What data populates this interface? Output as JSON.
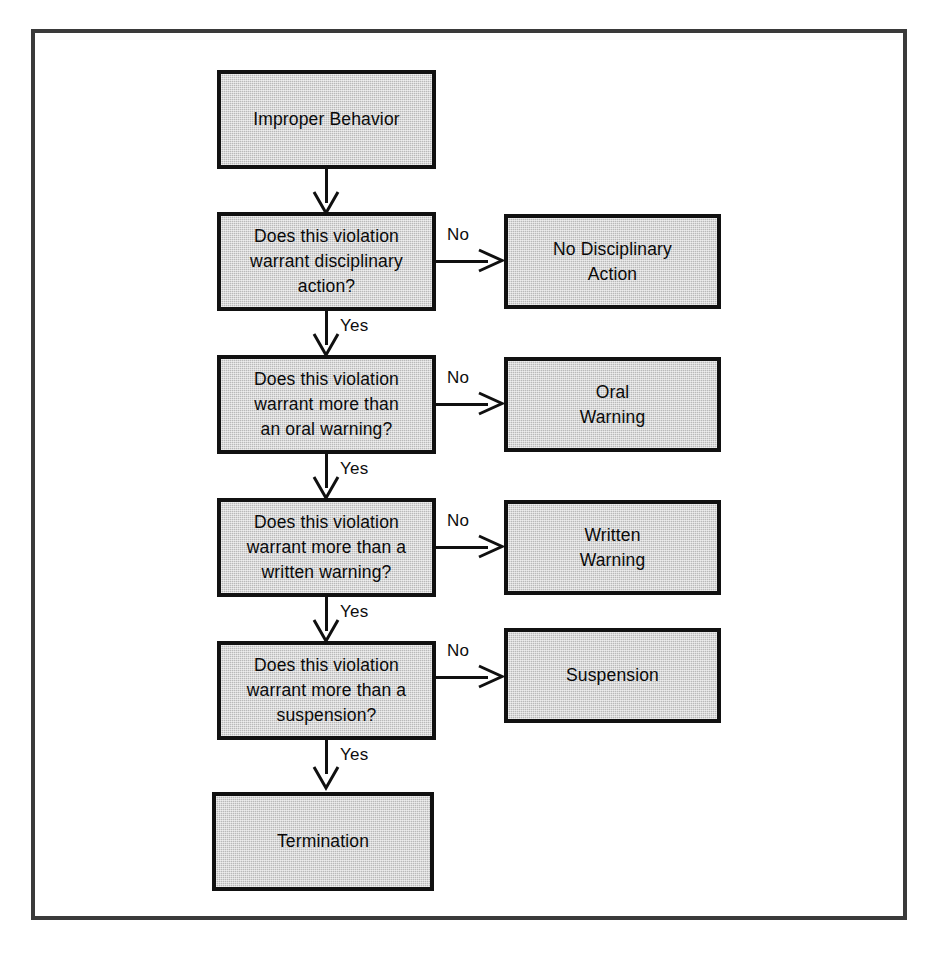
{
  "diagram": {
    "type": "flowchart",
    "colors": {
      "node_fill": "#b9b9b9",
      "node_border": "#111111",
      "frame_border": "#3a3a3a",
      "connector": "#101010",
      "background": "#ffffff",
      "text": "#0a0a0a"
    }
  },
  "nodes": {
    "start": {
      "id": "improper-behavior",
      "label": "Improper Behavior",
      "kind": "start"
    },
    "decision1": {
      "id": "decision-disciplinary-action",
      "label": "Does this violation\nwarrant disciplinary\naction?",
      "kind": "decision"
    },
    "decision2": {
      "id": "decision-more-than-oral-warning",
      "label": "Does this violation\nwarrant more than\nan oral warning?",
      "kind": "decision"
    },
    "decision3": {
      "id": "decision-more-than-written-warning",
      "label": "Does this violation\nwarrant more than a\nwritten warning?",
      "kind": "decision"
    },
    "decision4": {
      "id": "decision-more-than-suspension",
      "label": "Does this violation\nwarrant more than a\nsuspension?",
      "kind": "decision"
    },
    "outcome1": {
      "id": "no-disciplinary-action",
      "label": "No Disciplinary\nAction",
      "kind": "outcome"
    },
    "outcome2": {
      "id": "oral-warning",
      "label": "Oral\nWarning",
      "kind": "outcome"
    },
    "outcome3": {
      "id": "written-warning",
      "label": "Written\nWarning",
      "kind": "outcome"
    },
    "outcome4": {
      "id": "suspension",
      "label": "Suspension",
      "kind": "outcome"
    },
    "end": {
      "id": "termination",
      "label": "Termination",
      "kind": "end"
    }
  },
  "edges": {
    "no1": {
      "label": "No",
      "from": "decision1",
      "to": "outcome1"
    },
    "no2": {
      "label": "No",
      "from": "decision2",
      "to": "outcome2"
    },
    "no3": {
      "label": "No",
      "from": "decision3",
      "to": "outcome3"
    },
    "no4": {
      "label": "No",
      "from": "decision4",
      "to": "outcome4"
    },
    "yes1": {
      "label": "Yes",
      "from": "decision1",
      "to": "decision2"
    },
    "yes2": {
      "label": "Yes",
      "from": "decision2",
      "to": "decision3"
    },
    "yes3": {
      "label": "Yes",
      "from": "decision3",
      "to": "decision4"
    },
    "yes4": {
      "label": "Yes",
      "from": "decision4",
      "to": "end"
    },
    "start_to_decision1": {
      "label": "",
      "from": "start",
      "to": "decision1"
    }
  }
}
